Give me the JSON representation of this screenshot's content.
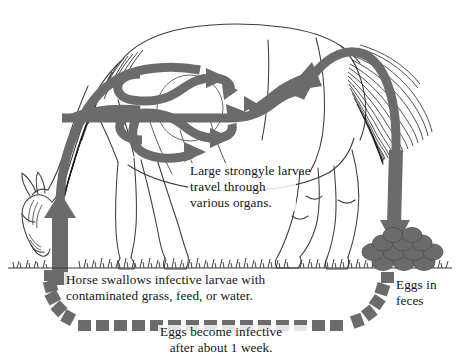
{
  "diagram": {
    "subject": "horse",
    "colors": {
      "arrow_gray": "#6b6b6b",
      "arrow_gray_dark": "#5d5d5d",
      "outline": "#3c3c3c",
      "background": "#ffffff",
      "text": "#141414",
      "grass": "#2e2e2e"
    }
  },
  "captions": {
    "organs": {
      "line1": "Large strongyle larvae",
      "line2": "travel through",
      "line3": "various organs."
    },
    "swallow": {
      "line1": "Horse swallows infective larvae with",
      "line2": "contaminated grass, feed, or water."
    },
    "infective": {
      "line1": "Eggs become infective",
      "line2": "after about 1 week."
    },
    "feces": {
      "line1": "Eggs in",
      "line2": "feces"
    }
  },
  "elements": {
    "ingestion_arrow": "upward-arrow-into-mouth",
    "migration_arrows": "internal-looping-arrows",
    "excretion_arrow": "downward-arrow-to-feces",
    "manure_pile": "eggs-in-feces-pile",
    "dashed_path": "eggs-become-infective-track",
    "grass_line": "pasture-ground-line",
    "horse_figure": "grazing-horse-outline",
    "organ_circle": "abdominal-organ-outline"
  },
  "counts": {
    "manure_balls": 12,
    "dashed_squares": 27
  }
}
